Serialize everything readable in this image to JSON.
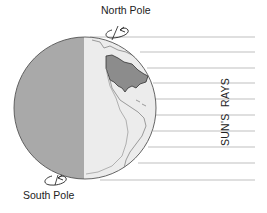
{
  "diagram": {
    "labels": {
      "north_pole": "North Pole",
      "south_pole": "South Pole",
      "suns_rays": "SUN'S  RAYS"
    },
    "colors": {
      "night_side": "#a9a9a9",
      "day_side": "#ececec",
      "land_highlight": "#8c8c8c",
      "outline": "#555555",
      "rays": "#d4d4d4",
      "text": "#222222"
    },
    "globe": {
      "cx": 85,
      "cy": 108,
      "r": 71,
      "terminator_x": 84
    },
    "rays": {
      "x_end": 255,
      "y_positions": [
        37,
        52,
        68,
        83,
        99,
        115,
        131,
        147,
        163,
        180
      ]
    },
    "rotation_arrows": [
      "north-pole-rotation",
      "south-pole-rotation"
    ]
  }
}
